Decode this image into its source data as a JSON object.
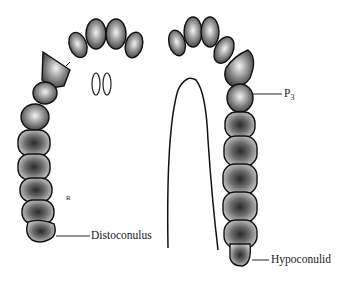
{
  "figure": {
    "labels": {
      "p3": {
        "main": "P",
        "sub": "3"
      },
      "distoconulus": "Distoconulus",
      "hypoconulid": "Hypoconulid",
      "side_mark": "R"
    }
  }
}
